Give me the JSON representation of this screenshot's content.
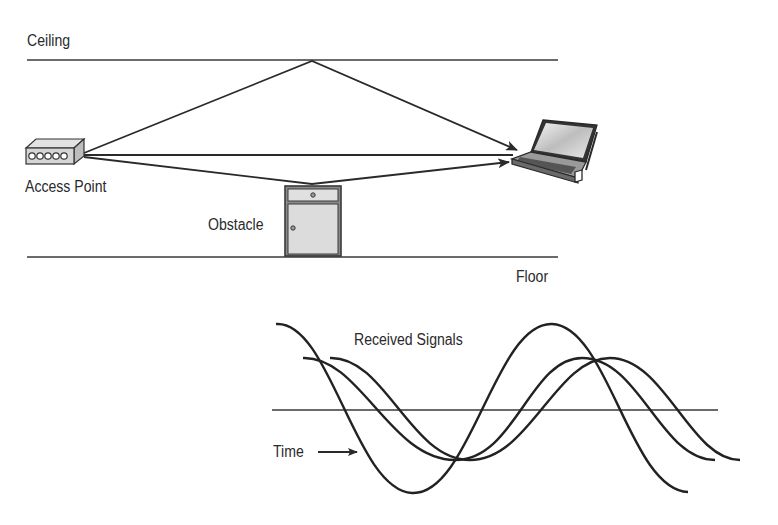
{
  "diagram": {
    "labels": {
      "ceiling": "Ceiling",
      "floor": "Floor",
      "access_point": "Access Point",
      "obstacle": "Obstacle",
      "received_signals": "Received Signals",
      "time": "Time"
    },
    "elements": {
      "transmitter": "access-point-icon",
      "receiver": "laptop-icon",
      "obstacle": "cabinet-icon"
    },
    "paths": [
      {
        "name": "ceiling-reflection",
        "from": "Access Point",
        "via": "Ceiling",
        "to": "Laptop"
      },
      {
        "name": "direct-path",
        "from": "Access Point",
        "to": "Laptop"
      },
      {
        "name": "obstacle-reflection",
        "from": "Access Point",
        "via": "Obstacle",
        "to": "Laptop"
      }
    ],
    "waveforms": {
      "count": 3,
      "description": "Three phase-shifted sine waves received at different times"
    },
    "colors": {
      "line": "#2a2a2a",
      "fill_gray": "#d9d9d9",
      "background": "#ffffff"
    }
  }
}
